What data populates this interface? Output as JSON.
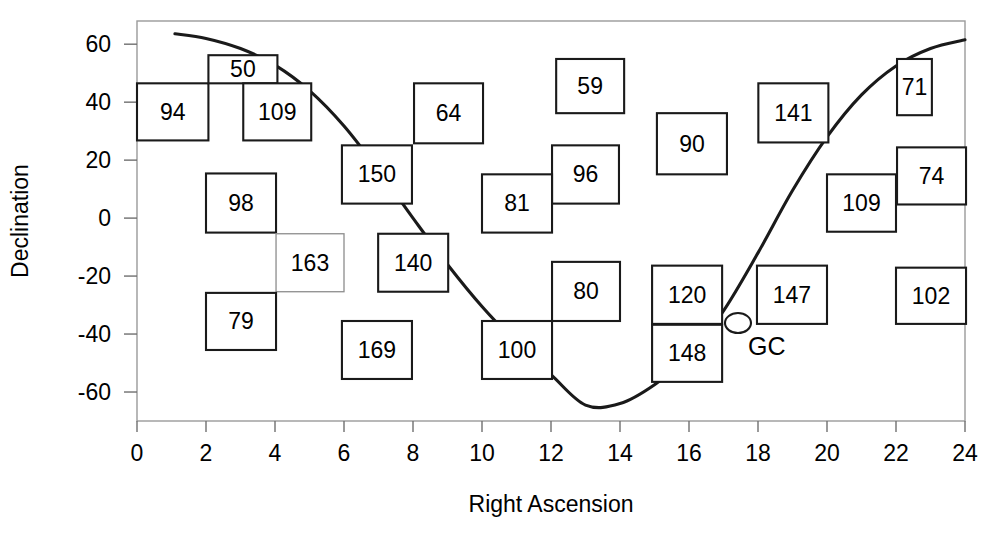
{
  "chart_data": {
    "type": "scatter",
    "title": "",
    "xlabel": "Right Ascension",
    "ylabel": "Declination",
    "xlim": [
      0,
      24
    ],
    "ylim": [
      -70,
      68
    ],
    "xticks": [
      0,
      2,
      4,
      6,
      8,
      10,
      12,
      14,
      16,
      18,
      20,
      22,
      24
    ],
    "yticks": [
      60,
      40,
      20,
      0,
      -20,
      -40,
      -60
    ],
    "xtick_labels": [
      "0",
      "2",
      "4",
      "6",
      "8",
      "10",
      "12",
      "14",
      "16",
      "18",
      "20",
      "22",
      "24"
    ],
    "ytick_labels": [
      "60",
      "40",
      "20",
      "0",
      "-20",
      "-40",
      "-60"
    ],
    "grid": false,
    "legend": "none",
    "boxes": [
      {
        "label": "94",
        "x": 0.0,
        "y": 46.5,
        "x2": 2.07,
        "y2": 26.8,
        "style": "normal"
      },
      {
        "label": "50",
        "x": 2.07,
        "y": 56.2,
        "x2": 4.07,
        "y2": 46.5,
        "style": "normal"
      },
      {
        "label": "109",
        "x": 3.08,
        "y": 46.5,
        "x2": 5.05,
        "y2": 26.8,
        "style": "normal"
      },
      {
        "label": "64",
        "x": 8.03,
        "y": 46.5,
        "x2": 10.03,
        "y2": 25.8,
        "style": "normal"
      },
      {
        "label": "59",
        "x": 12.15,
        "y": 54.9,
        "x2": 14.12,
        "y2": 36.2,
        "style": "normal"
      },
      {
        "label": "141",
        "x": 18.01,
        "y": 46.5,
        "x2": 20.04,
        "y2": 26.1,
        "style": "normal"
      },
      {
        "label": "71",
        "x": 22.03,
        "y": 54.9,
        "x2": 23.04,
        "y2": 35.5,
        "style": "normal"
      },
      {
        "label": "90",
        "x": 15.07,
        "y": 36.2,
        "x2": 17.1,
        "y2": 15.1,
        "style": "normal"
      },
      {
        "label": "150",
        "x": 5.94,
        "y": 25.1,
        "x2": 7.97,
        "y2": 5.0,
        "style": "normal"
      },
      {
        "label": "96",
        "x": 12.03,
        "y": 25.1,
        "x2": 13.97,
        "y2": 5.0,
        "style": "normal"
      },
      {
        "label": "81",
        "x": 10.0,
        "y": 15.1,
        "x2": 12.03,
        "y2": -5.0,
        "style": "normal"
      },
      {
        "label": "98",
        "x": 2.0,
        "y": 15.4,
        "x2": 4.03,
        "y2": -5.0,
        "style": "normal"
      },
      {
        "label": "109",
        "x": 20.0,
        "y": 15.1,
        "x2": 22.0,
        "y2": -4.7,
        "style": "normal"
      },
      {
        "label": "74",
        "x": 22.03,
        "y": 24.4,
        "x2": 24.03,
        "y2": 4.7,
        "style": "normal"
      },
      {
        "label": "163",
        "x": 4.03,
        "y": -5.4,
        "x2": 6.0,
        "y2": -25.4,
        "style": "light"
      },
      {
        "label": "140",
        "x": 6.99,
        "y": -5.4,
        "x2": 9.02,
        "y2": -25.4,
        "style": "normal"
      },
      {
        "label": "79",
        "x": 2.0,
        "y": -25.8,
        "x2": 4.03,
        "y2": -45.5,
        "style": "normal"
      },
      {
        "label": "80",
        "x": 12.03,
        "y": -15.1,
        "x2": 14.0,
        "y2": -35.5,
        "style": "normal"
      },
      {
        "label": "120",
        "x": 14.93,
        "y": -16.4,
        "x2": 16.96,
        "y2": -36.5,
        "style": "normal"
      },
      {
        "label": "147",
        "x": 17.97,
        "y": -16.4,
        "x2": 20.0,
        "y2": -36.5,
        "style": "normal"
      },
      {
        "label": "102",
        "x": 22.0,
        "y": -17.1,
        "x2": 24.03,
        "y2": -36.5,
        "style": "normal"
      },
      {
        "label": "100",
        "x": 10.0,
        "y": -35.5,
        "x2": 12.03,
        "y2": -55.5,
        "style": "normal"
      },
      {
        "label": "148",
        "x": 14.93,
        "y": -36.8,
        "x2": 16.96,
        "y2": -56.5,
        "style": "normal"
      },
      {
        "label": "169",
        "x": 5.94,
        "y": -35.5,
        "x2": 7.97,
        "y2": -55.5,
        "style": "normal"
      }
    ],
    "plane_curve": {
      "name": "galactic-plane",
      "points": [
        [
          1.1,
          63.6
        ],
        [
          2.0,
          62.0
        ],
        [
          3.0,
          58.5
        ],
        [
          4.0,
          52.8
        ],
        [
          5.0,
          44.0
        ],
        [
          6.0,
          31.8
        ],
        [
          7.0,
          16.5
        ],
        [
          8.0,
          0.0
        ],
        [
          9.0,
          -16.0
        ],
        [
          10.0,
          -30.5
        ],
        [
          11.0,
          -43.0
        ],
        [
          12.0,
          -54.0
        ],
        [
          13.0,
          -64.5
        ],
        [
          14.0,
          -64.0
        ],
        [
          15.0,
          -57.5
        ],
        [
          16.0,
          -47.5
        ],
        [
          17.0,
          -32.0
        ],
        [
          17.45,
          -36.0
        ],
        [
          18.0,
          -12.0
        ],
        [
          19.0,
          9.5
        ],
        [
          20.0,
          28.0
        ],
        [
          21.0,
          42.5
        ],
        [
          22.0,
          52.5
        ],
        [
          23.0,
          58.5
        ],
        [
          24.0,
          61.5
        ]
      ]
    },
    "markers": [
      {
        "name": "galactic-center",
        "label": "GC",
        "x": 17.42,
        "y": -36.2
      }
    ]
  },
  "axes": {
    "x_label": "Right Ascension",
    "y_label": "Declination"
  }
}
